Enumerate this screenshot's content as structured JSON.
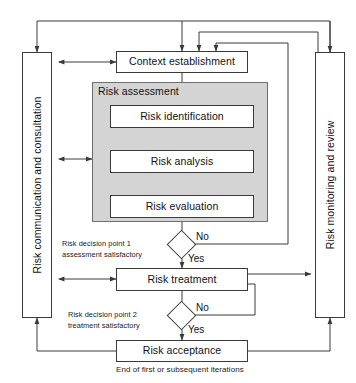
{
  "diagram": {
    "canvas": {
      "width": 356,
      "height": 383
    },
    "colors": {
      "line": "#3a3a3a",
      "group_fill": "#d4d4d4",
      "group_border": "#6e6e6e",
      "node_fill": "#ffffff",
      "text": "#111111",
      "background": "#ffffff"
    }
  },
  "side_panels": {
    "left": {
      "label": "Risk communication and consultation"
    },
    "right": {
      "label": "Risk monitoring and review"
    }
  },
  "group": {
    "risk_assessment": {
      "label": "Risk assessment"
    }
  },
  "nodes": {
    "context_establishment": {
      "label": "Context establishment"
    },
    "risk_identification": {
      "label": "Risk identification"
    },
    "risk_analysis": {
      "label": "Risk analysis"
    },
    "risk_evaluation": {
      "label": "Risk evaluation"
    },
    "risk_treatment": {
      "label": "Risk treatment"
    },
    "risk_acceptance": {
      "label": "Risk acceptance"
    }
  },
  "decisions": {
    "point1": {
      "note_line1": "Risk decision point 1",
      "note_line2": "assessment satisfactory",
      "yes_label": "Yes",
      "no_label": "No"
    },
    "point2": {
      "note_line1": "Risk decision point 2",
      "note_line2": "treatment satisfactory",
      "yes_label": "Yes",
      "no_label": "No"
    }
  },
  "caption": {
    "end_of_iteration": "End of first or subsequent iterations"
  }
}
